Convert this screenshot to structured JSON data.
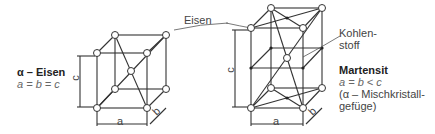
{
  "labels": {
    "eisen": "Eisen",
    "kohlenstoff_1": "Kohlen-",
    "kohlenstoff_2": "stoff",
    "alpha_title": "α – Eisen",
    "alpha_relation": "a = b = c",
    "martensit_title": "Martensit",
    "martensit_relation": "a = b < c",
    "martensit_note_1": "(α – Mischkristall-",
    "martensit_note_2": "gefüge)",
    "dim_a": "a",
    "dim_b": "b",
    "dim_c": "c"
  },
  "colors": {
    "line": "#333333",
    "atom_fill": "#ffffff"
  }
}
